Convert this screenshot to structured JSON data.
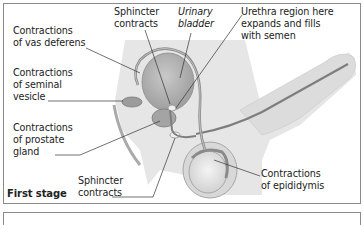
{
  "figure": {
    "stage_title": "First stage",
    "labels": {
      "vas_deferens": "Contractions\nof vas deferens",
      "seminal_vesicle": "Contractions\nof seminal\nvesicle",
      "prostate": "Contractions\nof prostate\ngland",
      "sphincter_top": "Sphincter\ncontracts",
      "sphincter_bottom": "Sphincter\ncontracts",
      "urinary_bladder": "Urinary\nbladder",
      "urethra": "Urethra region here\nexpands and fills\nwith semen",
      "epididymis": "Contractions\nof epididymis"
    },
    "colors": {
      "skin": "#e4e4e4",
      "organ": "#b8b8b8",
      "outline": "#8c8c8c",
      "duct": "#7a7a7a",
      "leader": "#333333"
    }
  }
}
